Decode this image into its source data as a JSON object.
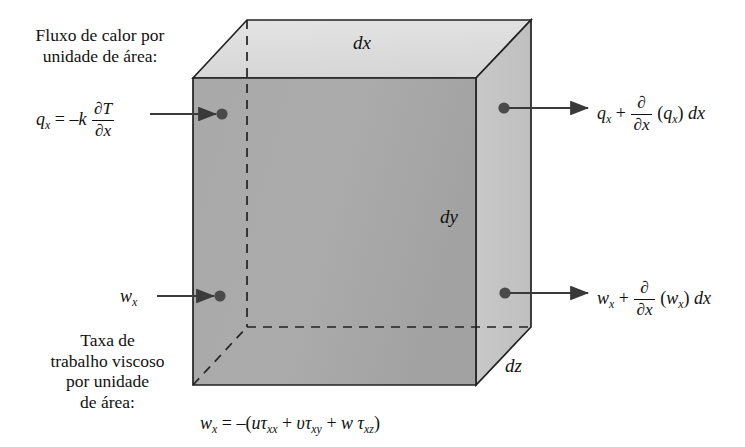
{
  "figure": {
    "title_semantic": "differential-control-volume-energy-balance",
    "language": "pt-BR",
    "colors": {
      "top_face": "#dedede",
      "front_face": "#a8a8a8",
      "right_face": "#c5c5c5",
      "outline": "#222222",
      "hidden_edge": "#222222",
      "arrow": "#3a3a3a",
      "background": "#ffffff",
      "text": "#111111"
    },
    "labels": {
      "heat_flux_caption_line1": "Fluxo de calor por",
      "heat_flux_caption_line2": "unidade de área:",
      "viscous_caption_line1": "Taxa de",
      "viscous_caption_line2": "trabalho viscoso",
      "viscous_caption_line3": "por unidade",
      "viscous_caption_line4": "de área:"
    },
    "dimensions": {
      "dx": "dx",
      "dy": "dy",
      "dz": "dz"
    },
    "formulas": {
      "heat_flux_in": {
        "lhs_symbol": "q",
        "lhs_sub": "x",
        "equals": "=",
        "coefficient": "–k",
        "frac_num": "∂T",
        "frac_den": "∂x"
      },
      "heat_flux_out": {
        "base_symbol": "q",
        "base_sub": "x",
        "plus": "+",
        "frac_num": "∂",
        "frac_den": "∂x",
        "operand_open": "(",
        "operand_symbol": "q",
        "operand_sub": "x",
        "operand_close": ")",
        "differential": "dx"
      },
      "viscous_work_in": {
        "symbol": "w",
        "sub": "x"
      },
      "viscous_work_out": {
        "base_symbol": "w",
        "base_sub": "x",
        "plus": "+",
        "frac_num": "∂",
        "frac_den": "∂x",
        "operand_open": "(",
        "operand_symbol": "w",
        "operand_sub": "x",
        "operand_close": ")",
        "differential": "dx"
      },
      "viscous_work_definition": {
        "lhs_symbol": "w",
        "lhs_sub": "x",
        "equals": "=",
        "minus_open": "–(",
        "term1_u": "u",
        "term1_tau": "τ",
        "term1_sub": "xx",
        "plus1": "+",
        "term2_v": "υ",
        "term2_tau": "τ",
        "term2_sub": "xy",
        "plus2": "+",
        "term3_w": "w",
        "term3_tau": "τ",
        "term3_sub": "xz",
        "close": ")"
      }
    }
  }
}
